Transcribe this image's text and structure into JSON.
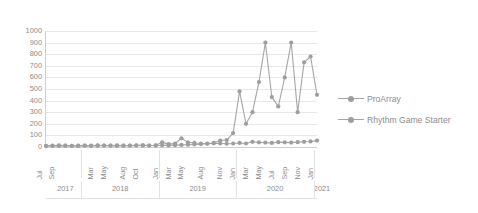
{
  "chart_data": {
    "type": "line",
    "title": "",
    "xlabel": "",
    "ylabel": "",
    "ylim": [
      0,
      1000
    ],
    "ytick_values": [
      1000,
      900,
      800,
      700,
      600,
      500,
      400,
      300,
      200,
      100,
      0
    ],
    "grid": true,
    "legend_position": "right",
    "axis_color": "#d0d0d0",
    "grid_color": "#e8e8e8",
    "series_color": "#a6a6a6",
    "marker_color": "#9e9e9e",
    "x": [
      "Jul 2017",
      "Aug 2017",
      "Sep 2017",
      "Oct 2017",
      "Nov 2017",
      "Dec 2017",
      "Jan 2018",
      "Feb 2018",
      "Mar 2018",
      "Apr 2018",
      "May 2018",
      "Jun 2018",
      "Jul 2018",
      "Aug 2018",
      "Sep 2018",
      "Oct 2018",
      "Nov 2018",
      "Dec 2018",
      "Jan 2019",
      "Feb 2019",
      "Mar 2019",
      "Apr 2019",
      "May 2019",
      "Jun 2019",
      "Jul 2019",
      "Aug 2019",
      "Sep 2019",
      "Oct 2019",
      "Nov 2019",
      "Dec 2019",
      "Jan 2020",
      "Feb 2020",
      "Mar 2020",
      "Apr 2020",
      "May 2020",
      "Jun 2020",
      "Jul 2020",
      "Aug 2020",
      "Sep 2020",
      "Oct 2020",
      "Nov 2020",
      "Dec 2020",
      "Jan 2021"
    ],
    "month_tick_labels": [
      "Jul",
      "",
      "Sep",
      "",
      "Nov",
      "",
      "Jan",
      "",
      "Mar",
      "",
      "May",
      "",
      "Jul",
      "",
      "Aug",
      "",
      "Oct",
      "",
      "Jan",
      "",
      "Mar",
      "",
      "May",
      "",
      "Jul",
      "",
      "Aug",
      "",
      "Nov",
      "",
      "Jan",
      "",
      "Mar",
      "",
      "May",
      "",
      "Jul",
      "",
      "Sep",
      "",
      "Nov",
      "",
      "Jan"
    ],
    "month_labels_visible": [
      {
        "index": 0,
        "label": "Jul"
      },
      {
        "index": 2,
        "label": "Sep"
      },
      {
        "index": 8,
        "label": "Mar"
      },
      {
        "index": 10,
        "label": "May"
      },
      {
        "index": 13,
        "label": "Aug"
      },
      {
        "index": 15,
        "label": "Oct"
      },
      {
        "index": 18,
        "label": "Jan"
      },
      {
        "index": 20,
        "label": "Mar"
      },
      {
        "index": 22,
        "label": "May"
      },
      {
        "index": 25,
        "label": "Aug"
      },
      {
        "index": 28,
        "label": "Nov"
      },
      {
        "index": 30,
        "label": "Jan"
      },
      {
        "index": 32,
        "label": "Mar"
      },
      {
        "index": 34,
        "label": "May"
      },
      {
        "index": 36,
        "label": "Jul"
      },
      {
        "index": 38,
        "label": "Sep"
      },
      {
        "index": 40,
        "label": "Nov"
      },
      {
        "index": 42,
        "label": "Jan"
      }
    ],
    "year_groups": [
      {
        "label": "2017",
        "start": 0,
        "end": 5
      },
      {
        "label": "2018",
        "start": 6,
        "end": 17
      },
      {
        "label": "2019",
        "start": 18,
        "end": 29
      },
      {
        "label": "2020",
        "start": 30,
        "end": 41
      },
      {
        "label": "2021",
        "start": 42,
        "end": 42
      }
    ],
    "series": [
      {
        "name": "ProArray",
        "values": [
          10,
          12,
          14,
          12,
          10,
          11,
          13,
          12,
          14,
          13,
          12,
          14,
          13,
          12,
          15,
          14,
          13,
          15,
          40,
          25,
          30,
          75,
          40,
          35,
          30,
          28,
          32,
          30,
          28,
          30,
          35,
          30,
          45,
          40,
          38,
          35,
          42,
          40,
          38,
          42,
          45,
          48,
          55
        ]
      },
      {
        "name": "Rhythm Game Starter",
        "values": [
          8,
          10,
          9,
          11,
          10,
          9,
          12,
          10,
          11,
          13,
          12,
          10,
          11,
          13,
          12,
          14,
          13,
          12,
          15,
          14,
          16,
          18,
          20,
          22,
          25,
          30,
          35,
          55,
          60,
          120,
          480,
          200,
          300,
          560,
          900,
          430,
          350,
          600,
          900,
          300,
          730,
          780,
          450
        ]
      }
    ]
  },
  "legend": {
    "items": [
      {
        "label": "ProArray"
      },
      {
        "label": "Rhythm Game Starter"
      }
    ]
  }
}
